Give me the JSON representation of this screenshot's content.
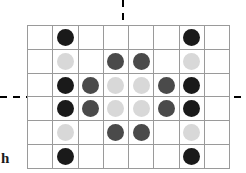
{
  "figure": {
    "type": "lattice-grid-diagram",
    "title": "",
    "corner_label": "h",
    "background_color": "#ffffff",
    "grid_line_color": "#9a9a9a",
    "axis_color": "#000000"
  },
  "grid": {
    "columns": 8,
    "rows": 6,
    "cell_width_px": 24.25,
    "cell_height_px": 22.83,
    "origin_x_px": 27,
    "origin_y_px": 25
  },
  "axes": {
    "horizontal": {
      "label": "",
      "style": "solid-bold",
      "position_row_boundary": 3,
      "extension_style": "dashed",
      "thickness_px": 3
    },
    "vertical": {
      "label": "",
      "style": "solid-bold",
      "position_column_boundary": 4,
      "extension_style": "dashed",
      "thickness_px": 3
    }
  },
  "legend": {
    "shades": [
      {
        "name": "dark",
        "color": "#1a1a1a",
        "label": ""
      },
      {
        "name": "mid",
        "color": "#4a4a4a",
        "label": ""
      },
      {
        "name": "light",
        "color": "#d8d8d8",
        "label": ""
      }
    ]
  },
  "chart_data": {
    "type": "heatmap",
    "title": "",
    "xlabel": "",
    "ylabel": "",
    "categories_x": [
      "1",
      "2",
      "3",
      "4",
      "5",
      "6",
      "7",
      "8"
    ],
    "categories_y": [
      "1",
      "2",
      "3",
      "4",
      "5",
      "6"
    ],
    "legend_position": "none",
    "grid": true,
    "cells": [
      [
        null,
        "dark",
        null,
        null,
        null,
        null,
        "dark",
        null
      ],
      [
        null,
        "light",
        null,
        "mid",
        "mid",
        null,
        "light",
        null
      ],
      [
        null,
        "dark",
        "mid",
        "light",
        "light",
        "mid",
        "dark",
        null
      ],
      [
        null,
        "dark",
        "mid",
        "light",
        "light",
        "mid",
        "dark",
        null
      ],
      [
        null,
        "light",
        null,
        "mid",
        "mid",
        null,
        "light",
        null
      ],
      [
        null,
        "dark",
        null,
        null,
        null,
        null,
        "dark",
        null
      ]
    ]
  }
}
